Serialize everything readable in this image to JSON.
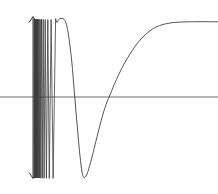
{
  "figure": {
    "title": "",
    "background_color": "#ffffff",
    "width": 218,
    "height": 194
  },
  "chart_data": {
    "type": "line",
    "title": "",
    "xlabel": "",
    "ylabel": "",
    "grid": false,
    "legend": null,
    "axes": {
      "x_axis": {
        "type": "horizontal-axis",
        "pixel_y": 97,
        "pixel_x_start": 0,
        "pixel_x_end": 218,
        "value": 0,
        "color": "#5a5a5a"
      },
      "y_axis": null,
      "xlim": [
        0,
        218
      ],
      "ylim": [
        194,
        0
      ]
    },
    "annotations": [
      {
        "name": "singularity-marker",
        "kind": "double-headed-vertical-arrow",
        "pixel_x": 33,
        "pixel_y_top": 17,
        "pixel_y_bottom": 178,
        "color": "#3a3a3a",
        "label": ""
      }
    ],
    "asymptote": {
      "name": "right-horizontal-asymptote",
      "pixel_y": 22,
      "approached_from": "below",
      "label": ""
    },
    "features": {
      "axis_crossings_pixel_x": [
        36.2,
        38.0,
        40.4,
        43.6,
        48.0,
        54.6,
        70.2,
        110.0
      ],
      "local_maxima_pixel": [
        [
          37.0,
          20.0
        ],
        [
          39.1,
          19.5
        ],
        [
          41.8,
          19.2
        ],
        [
          45.6,
          19.0
        ],
        [
          51.0,
          18.6
        ],
        [
          62.2,
          18.4
        ]
      ],
      "local_minima_pixel": [
        [
          36.6,
          177.0
        ],
        [
          37.5,
          177.5
        ],
        [
          38.5,
          178.0
        ],
        [
          39.8,
          178.0
        ],
        [
          42.6,
          178.0
        ],
        [
          46.2,
          178.5
        ],
        [
          51.8,
          178.5
        ],
        [
          83.0,
          177.0
        ]
      ],
      "final_trough_pixel": [
        83.0,
        177.0
      ],
      "final_rise_crossing_pixel_x": 110.0,
      "right_end_pixel": [
        218.0,
        22.0
      ]
    },
    "series": [
      {
        "name": "oscillating-branch",
        "color": "#3c3c3c",
        "stroke_width": 0.8,
        "note": "dense oscillation packet between x=34 and x=56 px, amplitude spanning y=19 to y=178",
        "points": [
          [
            34.0,
            178.0
          ],
          [
            34.15,
            19.0
          ],
          [
            34.3,
            178.0
          ],
          [
            34.45,
            19.0
          ],
          [
            34.6,
            178.0
          ],
          [
            34.75,
            19.0
          ],
          [
            34.9,
            178.0
          ],
          [
            35.05,
            19.0
          ],
          [
            35.2,
            178.0
          ],
          [
            35.4,
            19.0
          ],
          [
            35.6,
            178.0
          ],
          [
            35.8,
            19.0
          ],
          [
            36.0,
            178.0
          ],
          [
            36.25,
            19.0
          ],
          [
            36.5,
            178.0
          ],
          [
            36.8,
            19.2
          ],
          [
            37.1,
            178.0
          ],
          [
            37.45,
            19.2
          ],
          [
            37.8,
            178.0
          ],
          [
            38.2,
            19.2
          ],
          [
            38.6,
            178.0
          ],
          [
            39.1,
            19.3
          ],
          [
            39.6,
            178.0
          ],
          [
            40.2,
            19.3
          ],
          [
            40.8,
            178.2
          ],
          [
            41.5,
            19.4
          ],
          [
            42.3,
            178.2
          ],
          [
            43.2,
            19.4
          ],
          [
            44.1,
            178.3
          ],
          [
            45.2,
            19.5
          ],
          [
            46.4,
            178.3
          ],
          [
            47.8,
            19.6
          ],
          [
            49.3,
            178.4
          ],
          [
            51.1,
            19.6
          ],
          [
            53.1,
            178.4
          ],
          [
            55.6,
            19.0
          ]
        ]
      },
      {
        "name": "final-arch-and-asymptote",
        "color": "#4a4a4a",
        "stroke_width": 0.95,
        "note": "last upward arch peaking near x=62, then the large trough at x=83 and the monotone rise to the asymptote",
        "points": [
          [
            55.6,
            19.0
          ],
          [
            57.0,
            22.5
          ],
          [
            58.5,
            19.8
          ],
          [
            60.0,
            18.7
          ],
          [
            62.0,
            18.4
          ],
          [
            64.0,
            19.2
          ],
          [
            66.0,
            23.0
          ],
          [
            68.0,
            32.0
          ],
          [
            70.0,
            46.0
          ],
          [
            72.0,
            64.0
          ],
          [
            74.0,
            88.0
          ],
          [
            76.0,
            112.0
          ],
          [
            78.0,
            135.0
          ],
          [
            80.0,
            156.0
          ],
          [
            82.0,
            172.0
          ],
          [
            83.5,
            177.0
          ],
          [
            85.0,
            177.2
          ],
          [
            87.0,
            174.0
          ],
          [
            89.0,
            168.0
          ],
          [
            92.0,
            157.0
          ],
          [
            95.0,
            145.0
          ],
          [
            99.0,
            129.0
          ],
          [
            103.0,
            114.0
          ],
          [
            107.0,
            102.0
          ],
          [
            110.0,
            95.0
          ],
          [
            114.0,
            85.0
          ],
          [
            119.0,
            74.0
          ],
          [
            124.0,
            64.0
          ],
          [
            130.0,
            54.0
          ],
          [
            136.0,
            45.0
          ],
          [
            142.0,
            38.0
          ],
          [
            149.0,
            31.5
          ],
          [
            156.0,
            27.0
          ],
          [
            163.0,
            24.5
          ],
          [
            170.0,
            23.0
          ],
          [
            178.0,
            22.2
          ],
          [
            188.0,
            21.8
          ],
          [
            200.0,
            21.7
          ],
          [
            218.0,
            21.8
          ]
        ]
      }
    ]
  }
}
